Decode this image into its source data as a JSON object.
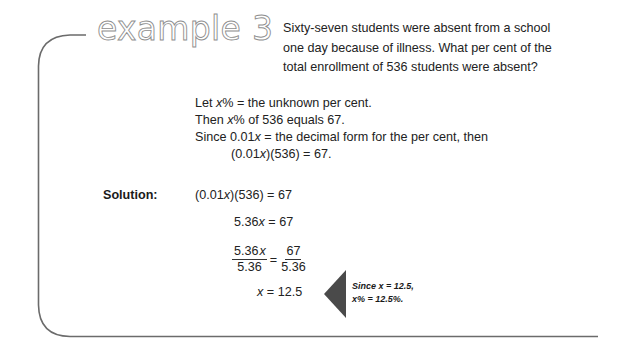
{
  "header": {
    "title": "example 3"
  },
  "problem": {
    "lines": [
      "Sixty-seven students were absent from a school",
      "one day because of illness. What per cent of the",
      "total enrollment of 536 students were absent?"
    ]
  },
  "setup": {
    "line1": {
      "var": "x",
      "rest": "% = the unknown per cent.",
      "prefix": "Let "
    },
    "line2": {
      "prefix": "Then ",
      "var": "x",
      "rest": "% of 536 equals 67."
    },
    "line3": {
      "prefix": "Since 0.01",
      "var": "x",
      "rest": " = the decimal form for the per cent, then"
    },
    "line4": {
      "prefix": "(0.01",
      "var": "x",
      "rest": ")(536) = 67."
    }
  },
  "solution": {
    "label": "Solution:",
    "step1": {
      "prefix": "(0.01",
      "var": "x",
      "rest": ")(536) = 67"
    },
    "step2": {
      "prefix": "5.36",
      "var": "x",
      "rest": " = 67"
    },
    "step3": {
      "left_num_prefix": "5.36",
      "left_num_var": "x",
      "left_den": "5.36",
      "equals": "=",
      "right_num": "67",
      "right_den": "5.36"
    },
    "step4": {
      "var": "x",
      "rest": " = 12.5"
    }
  },
  "note": {
    "line1": "Since x = 12.5,",
    "line2": "x% = 12.5%."
  },
  "colors": {
    "frame": "#6b6b6b",
    "title": "#8e8e8e",
    "triangle": "#4a4a4a",
    "text": "#222222"
  }
}
